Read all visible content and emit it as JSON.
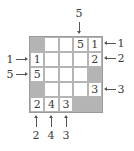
{
  "puzzle": {
    "rows": 5,
    "cols": 5,
    "cells": [
      [
        "#",
        "",
        "",
        "5",
        "1"
      ],
      [
        "1",
        "",
        "",
        "",
        "2"
      ],
      [
        "5",
        "",
        "",
        "",
        "#"
      ],
      [
        "#",
        "",
        "",
        "",
        "3"
      ],
      [
        "2",
        "4",
        "3",
        "#",
        "#"
      ]
    ],
    "clues": {
      "top": [
        {
          "col": 3,
          "value": "5"
        }
      ],
      "left": [
        {
          "row": 1,
          "value": "1"
        },
        {
          "row": 2,
          "value": "5"
        }
      ],
      "right": [
        {
          "row": 0,
          "value": "1"
        },
        {
          "row": 1,
          "value": "2"
        },
        {
          "row": 3,
          "value": "3"
        }
      ],
      "bottom": [
        {
          "col": 0,
          "value": "2"
        },
        {
          "col": 1,
          "value": "4"
        },
        {
          "col": 2,
          "value": "3"
        }
      ]
    },
    "colors": {
      "shaded": "#b4b4b4",
      "text": "#3a3a3a",
      "grid_line": "#b5b5b5"
    }
  }
}
